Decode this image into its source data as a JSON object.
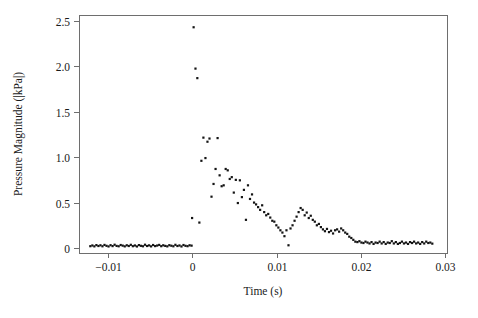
{
  "figure": {
    "background_color": "#ffffff",
    "frame_color": "#6e6e6e",
    "marker_color": "#141414"
  },
  "chart_data": {
    "type": "scatter",
    "title": "",
    "xlabel": "Time (s)",
    "ylabel": "Pressure Magnitude (|kPa|)",
    "xlim": [
      -0.0134,
      0.0302
    ],
    "ylim": [
      -0.055,
      2.565
    ],
    "xticks": [
      -0.01,
      0,
      0.01,
      0.02,
      0.03
    ],
    "xticklabels": [
      "−0.01",
      "0",
      "0.01",
      "0.02",
      "0.03"
    ],
    "yticks": [
      0,
      0.5,
      1.0,
      1.5,
      2.0,
      2.5
    ],
    "yticklabels": [
      "0",
      "0.5",
      "1.0",
      "1.5",
      "2.0",
      "2.5"
    ],
    "grid": false,
    "legend": null,
    "marker": "filled-square",
    "marker_size_px": 2.2,
    "series": [
      {
        "name": "Pressure Magnitude",
        "x": [
          -0.01206,
          -0.01182,
          -0.01158,
          -0.01134,
          -0.0111,
          -0.01086,
          -0.01062,
          -0.01038,
          -0.01014,
          -0.0099,
          -0.00966,
          -0.00942,
          -0.00918,
          -0.00894,
          -0.0087,
          -0.00846,
          -0.00822,
          -0.00798,
          -0.00774,
          -0.0075,
          -0.00726,
          -0.00702,
          -0.00678,
          -0.00654,
          -0.0063,
          -0.00606,
          -0.00582,
          -0.00558,
          -0.00534,
          -0.0051,
          -0.00486,
          -0.00462,
          -0.00438,
          -0.00414,
          -0.0039,
          -0.00366,
          -0.00342,
          -0.00318,
          -0.00294,
          -0.0027,
          -0.00246,
          -0.00222,
          -0.00198,
          -0.00174,
          -0.0015,
          -0.00126,
          -0.00102,
          -0.00078,
          -0.00054,
          -0.0003,
          -6e-05,
          0.0,
          0.00018,
          0.0004,
          0.00062,
          0.00086,
          0.0011,
          0.00134,
          0.00158,
          0.00182,
          0.00206,
          0.0023,
          0.00254,
          0.00278,
          0.00302,
          0.00326,
          0.0035,
          0.00374,
          0.00398,
          0.00422,
          0.00446,
          0.0047,
          0.00494,
          0.00518,
          0.00542,
          0.00566,
          0.0059,
          0.00614,
          0.00638,
          0.00662,
          0.00686,
          0.0071,
          0.00734,
          0.00758,
          0.00782,
          0.00806,
          0.0083,
          0.00854,
          0.00878,
          0.00902,
          0.00926,
          0.0095,
          0.00974,
          0.00998,
          0.01022,
          0.01046,
          0.0107,
          0.01094,
          0.01118,
          0.01142,
          0.01166,
          0.0119,
          0.01214,
          0.01238,
          0.01262,
          0.01286,
          0.0131,
          0.01334,
          0.01358,
          0.01382,
          0.01406,
          0.0143,
          0.01454,
          0.01478,
          0.01502,
          0.01526,
          0.0155,
          0.01574,
          0.01598,
          0.01622,
          0.01646,
          0.0167,
          0.01694,
          0.01718,
          0.01742,
          0.01766,
          0.0179,
          0.01814,
          0.01838,
          0.01862,
          0.01886,
          0.0191,
          0.01934,
          0.01958,
          0.01982,
          0.02006,
          0.0203,
          0.02054,
          0.02078,
          0.02102,
          0.02126,
          0.0215,
          0.02174,
          0.02198,
          0.02222,
          0.02246,
          0.0227,
          0.02294,
          0.02318,
          0.02342,
          0.02366,
          0.0239,
          0.02414,
          0.02438,
          0.02462,
          0.02486,
          0.0251,
          0.02534,
          0.02558,
          0.02582,
          0.02606,
          0.0263,
          0.02654,
          0.02678,
          0.02702,
          0.02726,
          0.0275,
          0.02774,
          0.02798,
          0.02822,
          0.02846
        ],
        "y": [
          0.02,
          0.028,
          0.018,
          0.032,
          0.022,
          0.03,
          0.019,
          0.034,
          0.024,
          0.017,
          0.031,
          0.021,
          0.036,
          0.023,
          0.019,
          0.033,
          0.026,
          0.018,
          0.03,
          0.022,
          0.035,
          0.02,
          0.028,
          0.017,
          0.032,
          0.024,
          0.019,
          0.036,
          0.022,
          0.029,
          0.018,
          0.033,
          0.021,
          0.027,
          0.034,
          0.02,
          0.03,
          0.023,
          0.018,
          0.031,
          0.025,
          0.019,
          0.035,
          0.022,
          0.028,
          0.017,
          0.033,
          0.024,
          0.02,
          0.03,
          0.026,
          0.33,
          2.43,
          1.975,
          1.87,
          0.28,
          0.96,
          1.215,
          0.99,
          1.17,
          1.205,
          0.565,
          0.705,
          0.87,
          1.21,
          0.8,
          0.68,
          0.69,
          0.87,
          0.855,
          0.76,
          0.78,
          0.61,
          0.75,
          0.495,
          0.745,
          0.56,
          0.64,
          0.31,
          0.69,
          0.54,
          0.59,
          0.5,
          0.48,
          0.45,
          0.42,
          0.47,
          0.395,
          0.36,
          0.375,
          0.335,
          0.3,
          0.29,
          0.25,
          0.225,
          0.195,
          0.17,
          0.13,
          0.195,
          0.03,
          0.215,
          0.25,
          0.3,
          0.345,
          0.395,
          0.44,
          0.42,
          0.36,
          0.39,
          0.33,
          0.355,
          0.31,
          0.29,
          0.25,
          0.265,
          0.23,
          0.205,
          0.185,
          0.21,
          0.175,
          0.19,
          0.16,
          0.195,
          0.205,
          0.18,
          0.215,
          0.195,
          0.17,
          0.155,
          0.125,
          0.11,
          0.09,
          0.07,
          0.065,
          0.075,
          0.06,
          0.055,
          0.07,
          0.06,
          0.05,
          0.065,
          0.045,
          0.06,
          0.055,
          0.07,
          0.05,
          0.065,
          0.045,
          0.06,
          0.055,
          0.075,
          0.05,
          0.065,
          0.045,
          0.055,
          0.07,
          0.05,
          0.06,
          0.045,
          0.065,
          0.055,
          0.07,
          0.05,
          0.06,
          0.045,
          0.065,
          0.05,
          0.07,
          0.055,
          0.06,
          0.048
        ]
      }
    ]
  }
}
